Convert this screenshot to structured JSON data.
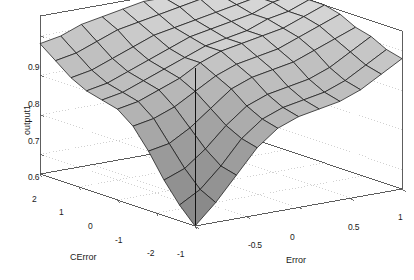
{
  "figure": {
    "background_color": "#ffffff",
    "surface_face_light": "#d9d9d9",
    "surface_face_dark": "#838383",
    "mesh_line_color": "#1a1a1a",
    "axis_line_color": "#4d4d4d",
    "gridline_color": "#b3b3b3"
  },
  "chart_data": {
    "type": "surface",
    "title": "",
    "xlabel": "Error",
    "ylabel": "CError",
    "zlabel": "output1",
    "xlim": [
      -1,
      1
    ],
    "ylim": [
      -2,
      2
    ],
    "zlim": [
      0.55,
      0.95
    ],
    "xticks": [
      "-1",
      "-0.5",
      "0",
      "0.5",
      "1"
    ],
    "xtick_values": [
      -1,
      -0.5,
      0,
      0.5,
      1
    ],
    "yticks": [
      "2",
      "1",
      "0",
      "-1",
      "-2"
    ],
    "ytick_values": [
      2,
      1,
      0,
      -1,
      -2
    ],
    "zticks": [
      "0.9",
      "0.8",
      "0.7",
      "0.6"
    ],
    "ztick_values": [
      0.9,
      0.8,
      0.7,
      0.6
    ],
    "grid": true,
    "legend": "none",
    "colormap": "gray",
    "shading": "faceted",
    "x": [
      -1,
      -0.8,
      -0.6,
      -0.4,
      -0.2,
      0,
      0.2,
      0.4,
      0.6,
      0.8,
      1
    ],
    "y": [
      -2,
      -1.6,
      -1.2,
      -0.8,
      -0.4,
      0,
      0.4,
      0.8,
      1.2,
      1.6,
      2
    ],
    "z": [
      [
        0.55,
        0.6,
        0.66,
        0.72,
        0.76,
        0.78,
        0.79,
        0.8,
        0.82,
        0.85,
        0.88
      ],
      [
        0.59,
        0.62,
        0.67,
        0.73,
        0.77,
        0.79,
        0.8,
        0.81,
        0.83,
        0.86,
        0.89
      ],
      [
        0.64,
        0.66,
        0.7,
        0.75,
        0.79,
        0.81,
        0.82,
        0.83,
        0.85,
        0.88,
        0.91
      ],
      [
        0.7,
        0.71,
        0.74,
        0.78,
        0.82,
        0.84,
        0.85,
        0.86,
        0.88,
        0.9,
        0.92
      ],
      [
        0.75,
        0.76,
        0.78,
        0.81,
        0.84,
        0.86,
        0.87,
        0.88,
        0.9,
        0.92,
        0.94
      ],
      [
        0.78,
        0.79,
        0.81,
        0.83,
        0.86,
        0.88,
        0.89,
        0.9,
        0.91,
        0.93,
        0.95
      ],
      [
        0.79,
        0.8,
        0.82,
        0.84,
        0.86,
        0.88,
        0.89,
        0.9,
        0.92,
        0.93,
        0.95
      ],
      [
        0.8,
        0.81,
        0.83,
        0.85,
        0.87,
        0.89,
        0.9,
        0.91,
        0.92,
        0.94,
        0.95
      ],
      [
        0.82,
        0.83,
        0.85,
        0.87,
        0.89,
        0.9,
        0.91,
        0.92,
        0.93,
        0.94,
        0.95
      ],
      [
        0.85,
        0.86,
        0.88,
        0.9,
        0.91,
        0.92,
        0.93,
        0.94,
        0.94,
        0.95,
        0.95
      ],
      [
        0.88,
        0.89,
        0.91,
        0.92,
        0.93,
        0.94,
        0.94,
        0.95,
        0.95,
        0.95,
        0.95
      ]
    ],
    "annotations": [],
    "view": {
      "azimuth": -37.5,
      "elevation": 30
    }
  }
}
